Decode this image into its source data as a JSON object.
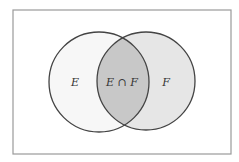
{
  "diagram": {
    "type": "venn",
    "canvas": {
      "width": 239,
      "height": 162,
      "background": "#ffffff"
    },
    "frame": {
      "x": 13,
      "y": 10,
      "width": 218,
      "height": 144,
      "stroke": "#9a9a9a",
      "stroke_width": 1.2
    },
    "sets": [
      {
        "id": "E",
        "label": "E",
        "cx": 99,
        "cy": 82,
        "r": 50,
        "fill": "#f7f7f7",
        "stroke": "#444444"
      },
      {
        "id": "F",
        "label": "F",
        "cx": 146,
        "cy": 81,
        "r": 49,
        "fill": "#e6e6e6",
        "stroke": "#444444"
      }
    ],
    "intersection": {
      "label": "E∩F",
      "fill": "#c8c8c8"
    },
    "labels": [
      {
        "region": "E_only",
        "text": "E",
        "x": 75,
        "y": 86
      },
      {
        "region": "E_and_F",
        "text": "E ∩ F",
        "x": 122,
        "y": 86
      },
      {
        "region": "F_only",
        "text": "F",
        "x": 166,
        "y": 86
      }
    ]
  }
}
